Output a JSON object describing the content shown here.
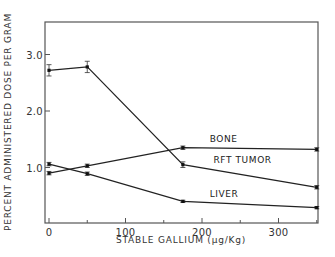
{
  "chart_data": {
    "type": "line",
    "title": "",
    "xlabel": "STABLE GALLIUM (µg/Kg)",
    "ylabel": "PERCENT ADMINISTERED DOSE PER GRAM",
    "xlim": [
      0,
      360
    ],
    "ylim": [
      0,
      3.6
    ],
    "x_ticks": [
      0,
      100,
      200,
      300
    ],
    "x_tick_labels": [
      "0",
      "100",
      "200",
      "300"
    ],
    "x_minor_ticks": [
      50,
      150,
      250,
      350
    ],
    "y_ticks": [
      1.0,
      2.0,
      3.0
    ],
    "y_tick_labels": [
      "1.0",
      "2.0",
      "3.0"
    ],
    "grid": false,
    "legend": "inline labels",
    "x": [
      0,
      50,
      175,
      350
    ],
    "series": [
      {
        "name": "RFT TUMOR",
        "values": [
          2.72,
          2.78,
          1.05,
          0.65
        ],
        "errors": [
          0.1,
          0.1,
          0.05,
          0.03
        ]
      },
      {
        "name": "BONE",
        "values": [
          0.9,
          1.03,
          1.35,
          1.32
        ],
        "errors": [
          0.03,
          0.03,
          0.03,
          0.03
        ]
      },
      {
        "name": "LIVER",
        "values": [
          1.06,
          0.89,
          0.4,
          0.29
        ],
        "errors": [
          0.03,
          0.03,
          0.02,
          0.02
        ]
      }
    ],
    "annotations": [
      {
        "text": "BONE",
        "x": 210,
        "y": 1.45
      },
      {
        "text": "RFT TUMOR",
        "x": 215,
        "y": 1.08
      },
      {
        "text": "LIVER",
        "x": 210,
        "y": 0.48
      }
    ]
  }
}
